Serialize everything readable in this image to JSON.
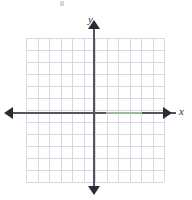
{
  "figure": {
    "axis_labels": {
      "x": "x",
      "y": "y"
    },
    "colors": {
      "background": "#ffffff",
      "grid_line": "#d8d8e2",
      "axis_line": "#55555f",
      "arrow_head": "#2b2b33",
      "label_text": "#33333a",
      "highlight_segment": "#a9cfa6"
    }
  },
  "chart_data": {
    "type": "scatter",
    "title": "",
    "subtitle": "",
    "xlabel": "x",
    "ylabel": "y",
    "xlim": [
      -6,
      6
    ],
    "ylim": [
      -6,
      6
    ],
    "xticks": [
      -6,
      -5,
      -4,
      -3,
      -2,
      -1,
      0,
      1,
      2,
      3,
      4,
      5,
      6
    ],
    "yticks": [
      -6,
      -5,
      -4,
      -3,
      -2,
      -1,
      0,
      1,
      2,
      3,
      4,
      5,
      6
    ],
    "xticklabels": [],
    "yticklabels": [],
    "grid": true,
    "grid_columns": 12,
    "grid_rows": 12,
    "legend": null,
    "legend_position": "none",
    "series": [],
    "annotations": []
  },
  "grid": {
    "vertical_line_offsets": [
      0,
      11.5,
      23,
      34.5,
      46,
      57.5,
      69,
      80.5,
      92,
      103.5,
      115,
      126.5,
      138
    ],
    "horizontal_line_offsets": [
      0,
      12,
      24,
      36,
      48,
      60,
      72,
      84,
      96,
      108,
      120,
      132,
      144
    ]
  },
  "icons": {
    "arrow_left": "arrow-left-icon",
    "arrow_right": "arrow-right-icon",
    "arrow_up": "arrow-up-icon",
    "arrow_down": "arrow-down-icon"
  }
}
